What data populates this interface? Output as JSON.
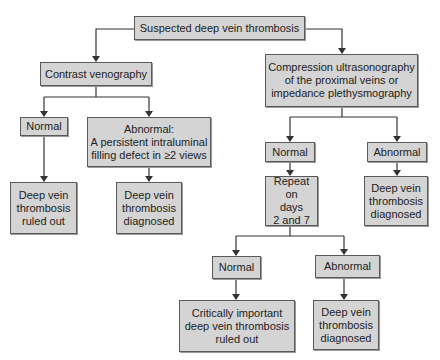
{
  "diagram": {
    "type": "flowchart",
    "colors": {
      "box_fill": "#d4d4d4",
      "box_border": "#5a5a5a",
      "line": "#333333",
      "background": "#ffffff"
    },
    "nodes": {
      "root": "Suspected deep vein thrombosis",
      "venography": "Contrast venography",
      "veno_normal": "Normal",
      "veno_abnormal": "Abnormal:\nA persistent intraluminal\nfilling defect in ≥2 views",
      "veno_ruled_out": "Deep vein\nthrombosis\nruled out",
      "veno_diagnosed": "Deep vein\nthrombosis\ndiagnosed",
      "cus": "Compression ultrasonography\nof the proximal veins or\nimpedance plethysmography",
      "cus_normal": "Normal",
      "cus_abnormal": "Abnormal",
      "repeat": "Repeat on\ndays\n2 and 7",
      "cus_diagnosed": "Deep vein\nthrombosis\ndiagnosed",
      "repeat_normal": "Normal",
      "repeat_abnormal": "Abnormal",
      "repeat_ruled_out": "Critically important\ndeep vein thrombosis\nruled out",
      "repeat_diagnosed": "Deep vein\nthrombosis\ndiagnosed"
    },
    "edges": [
      [
        "root",
        "venography"
      ],
      [
        "root",
        "cus"
      ],
      [
        "venography",
        "veno_normal"
      ],
      [
        "venography",
        "veno_abnormal"
      ],
      [
        "veno_normal",
        "veno_ruled_out"
      ],
      [
        "veno_abnormal",
        "veno_diagnosed"
      ],
      [
        "cus",
        "cus_normal"
      ],
      [
        "cus",
        "cus_abnormal"
      ],
      [
        "cus_normal",
        "repeat"
      ],
      [
        "cus_abnormal",
        "cus_diagnosed"
      ],
      [
        "repeat",
        "repeat_normal"
      ],
      [
        "repeat",
        "repeat_abnormal"
      ],
      [
        "repeat_normal",
        "repeat_ruled_out"
      ],
      [
        "repeat_abnormal",
        "repeat_diagnosed"
      ]
    ]
  }
}
